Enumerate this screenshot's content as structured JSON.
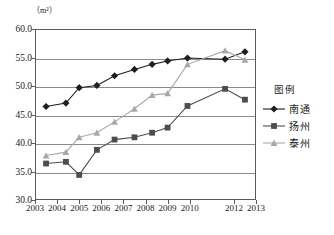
{
  "chart_data": {
    "type": "line",
    "title": "",
    "unit_label": "（m²）",
    "xlabel": "",
    "ylabel": "",
    "ylim": [
      30.0,
      60.0
    ],
    "xlim": [
      2003,
      2013
    ],
    "grid": true,
    "legend_position": "right",
    "legend_title": "图例",
    "ytick_labels": [
      "60.0",
      "55.0",
      "50.0",
      "45.0",
      "40.0",
      "35.0",
      "30.0"
    ],
    "ytick_values": [
      60.0,
      55.0,
      50.0,
      45.0,
      40.0,
      35.0,
      30.0
    ],
    "xtick_labels": [
      "2003",
      "2004",
      "2005",
      "2006",
      "2007",
      "2008",
      "2009",
      "2010",
      "2012",
      "2013"
    ],
    "xtick_values": [
      2003,
      2004,
      2005,
      2006,
      2007,
      2008,
      2009,
      2010,
      2012,
      2013
    ],
    "x": [
      2003.5,
      2004.4,
      2005.0,
      2005.8,
      2006.6,
      2007.5,
      2008.3,
      2009.0,
      2009.9,
      2011.6,
      2012.5
    ],
    "series": [
      {
        "name": "南通",
        "marker": "diamond",
        "color": "#1f1f1f",
        "values": [
          46.4,
          47.0,
          49.7,
          50.1,
          51.8,
          52.9,
          53.8,
          54.4,
          54.9,
          54.7,
          56.0
        ]
      },
      {
        "name": "扬州",
        "marker": "square",
        "color": "#4d4d4d",
        "values": [
          36.4,
          36.7,
          34.4,
          38.8,
          40.6,
          41.0,
          41.8,
          42.7,
          46.5,
          49.5,
          47.6
        ]
      },
      {
        "name": "泰州",
        "marker": "triangle",
        "color": "#a8a8a8",
        "values": [
          37.8,
          38.4,
          41.0,
          41.8,
          43.7,
          46.0,
          48.4,
          48.7,
          53.8,
          56.2,
          54.6
        ]
      }
    ]
  },
  "caption": ""
}
